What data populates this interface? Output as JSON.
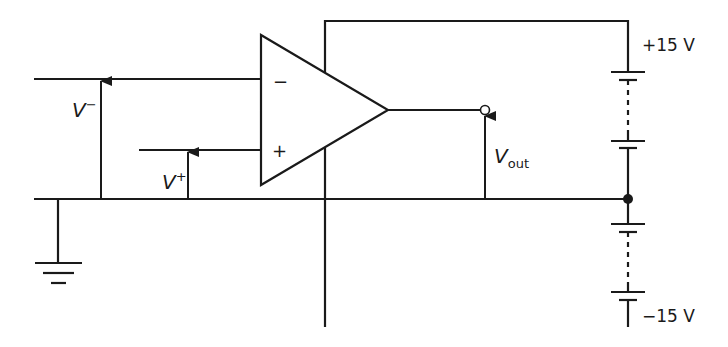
{
  "diagram": {
    "type": "op-amp circuit with dual power supply",
    "component": "operational amplifier",
    "inputs": {
      "inverting": {
        "symbol": "−",
        "voltage_label": "V",
        "voltage_sup": "−"
      },
      "non_inverting": {
        "symbol": "+",
        "voltage_label": "V",
        "voltage_sup": "+"
      }
    },
    "output": {
      "voltage_label": "V",
      "voltage_sub": "out"
    },
    "supply": {
      "positive": {
        "label": "+15 V"
      },
      "negative": {
        "label": "−15 V"
      }
    },
    "ground": {
      "symbol": "ground"
    },
    "colors": {
      "line": "#1a1a1a",
      "background": "#ffffff"
    }
  }
}
